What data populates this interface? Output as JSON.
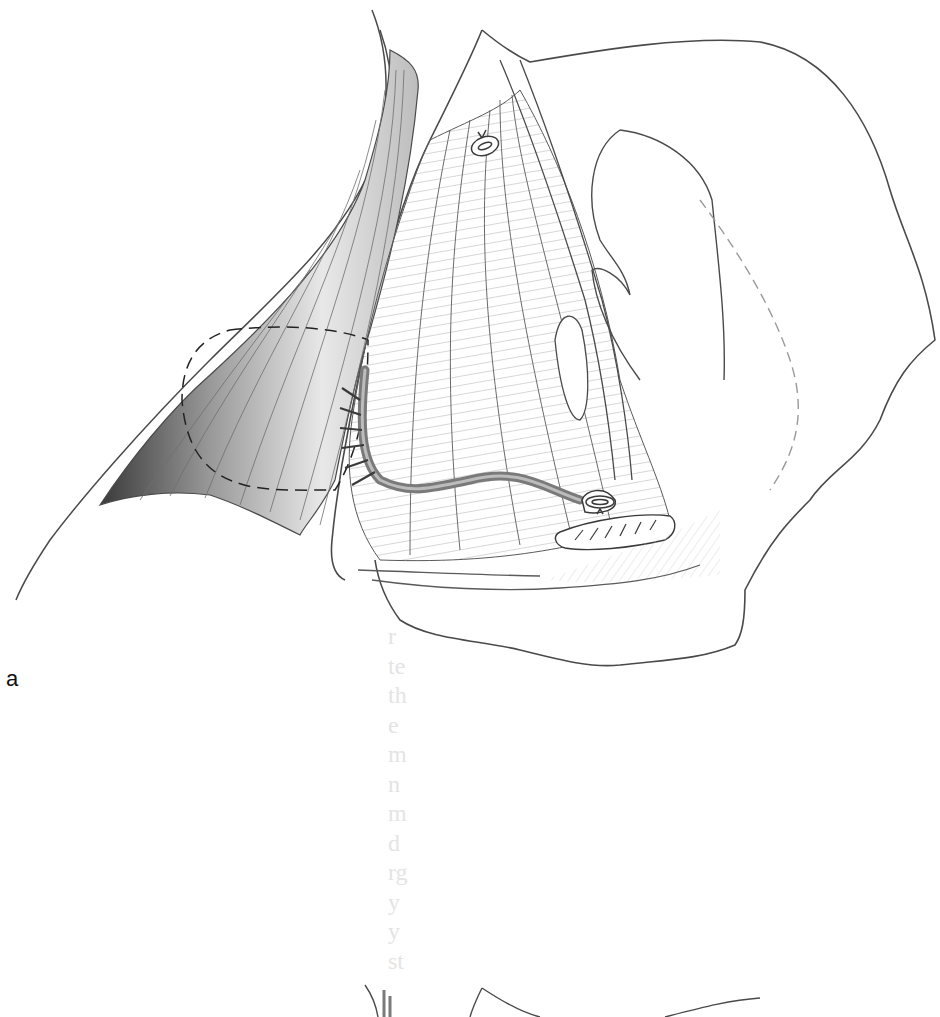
{
  "figure": {
    "panel_label": "a",
    "colors": {
      "background": "#ffffff",
      "line": "#4a4a4a",
      "shading_dark": "#5a5a5a",
      "shading_light": "#d8d8d8",
      "vessel": "#8a8a8a",
      "dashed_outline": "#222222"
    },
    "elements": {
      "muscle_flap": "reflected muscle flap (shaded, left)",
      "dashed_outline": "dashed circular outline of flap island",
      "vascular_pedicle": "pedicle vessel with branches",
      "ligature_top": "ligated vessel stump (top)",
      "ligature_bottom": "ligated vessel stump (bottom)",
      "retracted_tissue": "retracted tissue band (bottom right)",
      "wound_margin": "wound edge outline"
    }
  },
  "bleed_through_text": [
    "r",
    "te",
    "th",
    "e",
    "m",
    "n",
    "m",
    "d",
    "rg",
    "y",
    "y",
    "st"
  ]
}
